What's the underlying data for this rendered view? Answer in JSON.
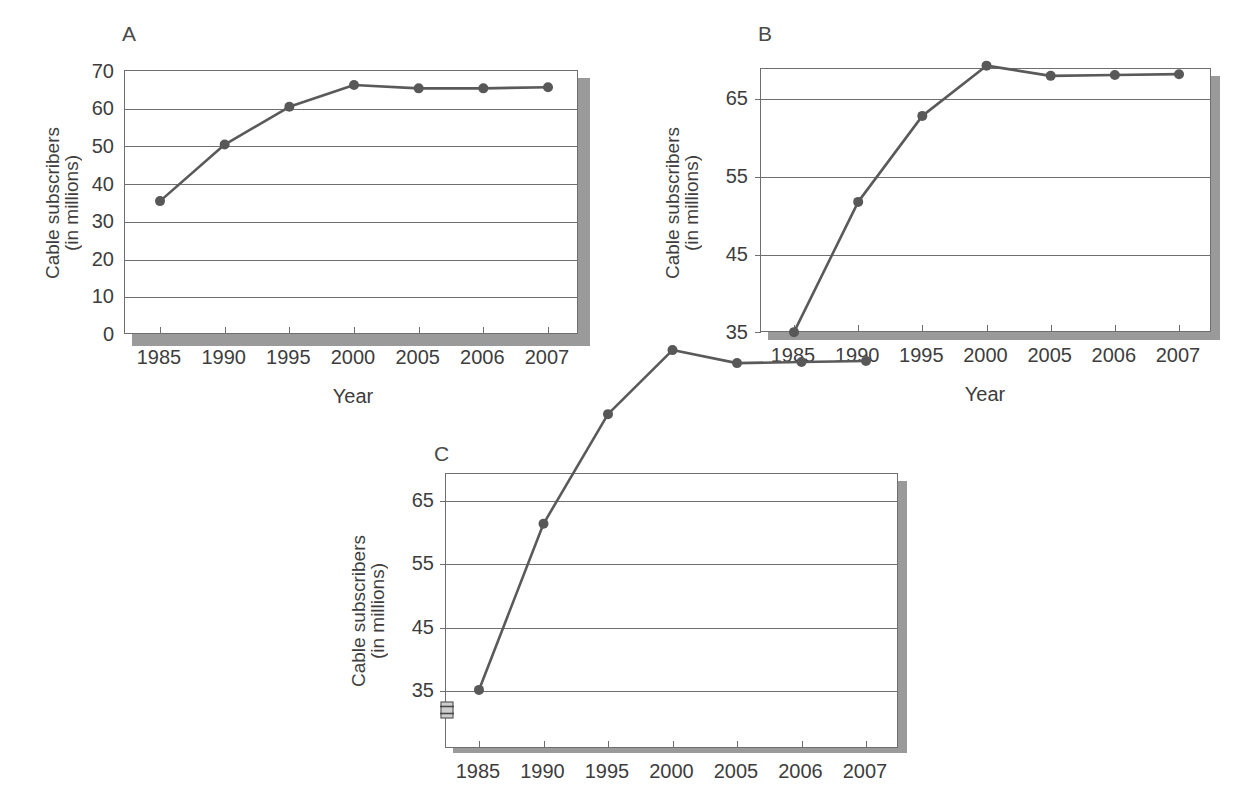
{
  "figure": {
    "background": "#ffffff",
    "line_color": "#5a5a5a",
    "marker_color": "#585858",
    "axis_color": "#6f6f6f",
    "shadow_color": "#9a9a9a",
    "text_color": "#3d3d3d"
  },
  "panels": [
    {
      "id": "A",
      "letter": "A",
      "ytitle_line1": "Cable subscribers",
      "ytitle_line2": "(in millions)",
      "xtitle": "Year",
      "yticks": [
        "70",
        "60",
        "50",
        "40",
        "30",
        "20",
        "10",
        "0"
      ],
      "xticks": [
        "1985",
        "1990",
        "1995",
        "2000",
        "2005",
        "2006",
        "2007"
      ],
      "has_axis_break": false,
      "chart_data": {
        "type": "line",
        "title": "A",
        "xlabel": "Year",
        "ylabel": "Cable subscribers (in millions)",
        "categories": [
          "1985",
          "1990",
          "1995",
          "2000",
          "2005",
          "2006",
          "2007"
        ],
        "values": [
          35.5,
          50.5,
          60.5,
          66.3,
          65.4,
          65.4,
          65.7
        ],
        "ylim": [
          0,
          70
        ],
        "ytick_values": [
          0,
          10,
          20,
          30,
          40,
          50,
          60,
          70
        ],
        "grid": true,
        "legend": "none"
      }
    },
    {
      "id": "B",
      "letter": "B",
      "ytitle_line1": "Cable subscribers",
      "ytitle_line2": "(in millions)",
      "xtitle": "Year",
      "yticks": [
        "65",
        "55",
        "45",
        "35"
      ],
      "xticks": [
        "1985",
        "1990",
        "1995",
        "2000",
        "2005",
        "2006",
        "2007"
      ],
      "has_axis_break": false,
      "chart_data": {
        "type": "line",
        "title": "B",
        "xlabel": "Year",
        "ylabel": "Cable subscribers (in millions)",
        "categories": [
          "1985",
          "1990",
          "1995",
          "2000",
          "2005",
          "2006",
          "2007"
        ],
        "values": [
          35.1,
          50.4,
          60.5,
          66.4,
          65.2,
          65.3,
          65.4
        ],
        "ylim": [
          35,
          70
        ],
        "ytick_values": [
          35,
          45,
          55,
          65
        ],
        "grid": true,
        "legend": "none"
      }
    },
    {
      "id": "C",
      "letter": "C",
      "ytitle_line1": "Cable subscribers",
      "ytitle_line2": "(in millions)",
      "xtitle": "",
      "yticks": [
        "65",
        "55",
        "45",
        "35"
      ],
      "xticks": [
        "1985",
        "1990",
        "1995",
        "2000",
        "2005",
        "2006",
        "2007"
      ],
      "has_axis_break": true,
      "axis_break_name": "y-axis-break-symbol",
      "chart_data": {
        "type": "line",
        "title": "C",
        "xlabel": "",
        "ylabel": "Cable subscribers (in millions)",
        "categories": [
          "1985",
          "1990",
          "1995",
          "2000",
          "2005",
          "2006",
          "2007"
        ],
        "values": [
          35.1,
          50.4,
          60.5,
          66.4,
          65.2,
          65.3,
          65.4
        ],
        "ylim": [
          35,
          70
        ],
        "ytick_values": [
          35,
          45,
          55,
          65
        ],
        "grid": true,
        "legend": "none",
        "axis_break": true
      }
    }
  ]
}
